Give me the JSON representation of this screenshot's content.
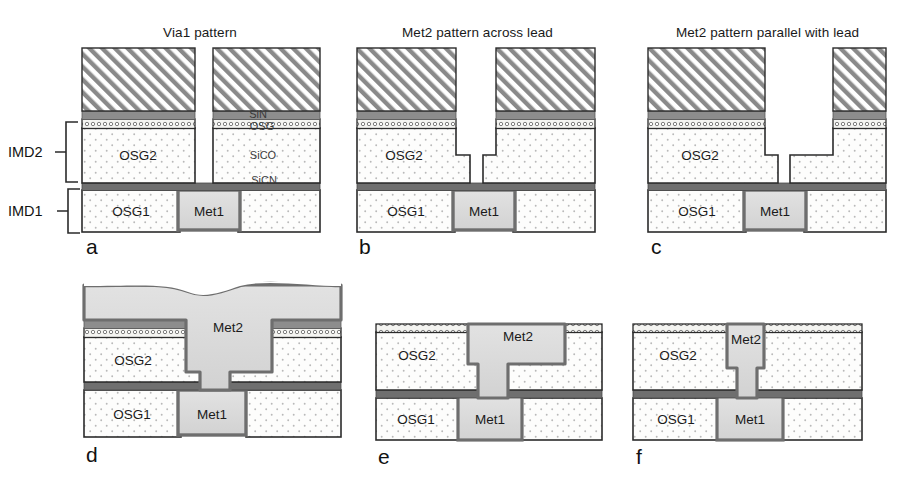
{
  "figure": {
    "caption_letters": [
      "a",
      "b",
      "c",
      "d",
      "e",
      "f"
    ],
    "colors": {
      "osg_fill": "#fdfdfc",
      "osg_dot": "#b9b9b9",
      "cap_osg_fill": "#f2f2ef",
      "sin_gray": "#8d8d8d",
      "sicn_dark": "#6f6f6f",
      "metal_fill": "#d9d9d9",
      "metal_edge": "#6e6e6e",
      "resist_hatch": "#8a8a8a",
      "outline": "#2b2b2b",
      "background": "#ffffff"
    }
  },
  "brackets": [
    {
      "id": "imd2",
      "label": "IMD2"
    },
    {
      "id": "imd1",
      "label": "IMD1"
    }
  ],
  "panels": [
    {
      "id": "a",
      "letter": "a",
      "title": "Via1 pattern",
      "layer_labels": [
        "OSG2",
        "OSG1",
        "Met1"
      ],
      "annotations": [
        "SiN",
        "OSG",
        "SiCO",
        "SiCN"
      ],
      "description": "Via1 photoresist pattern opened through stack down to Met1"
    },
    {
      "id": "b",
      "letter": "b",
      "title": "Met2 pattern across lead",
      "layer_labels": [
        "OSG2",
        "OSG1",
        "Met1"
      ],
      "annotations": [],
      "description": "Dual damascene trench etched across the Met1 lead"
    },
    {
      "id": "c",
      "letter": "c",
      "title": "Met2 pattern parallel with lead",
      "layer_labels": [
        "OSG2",
        "OSG1",
        "Met1"
      ],
      "annotations": [],
      "description": "Dual damascene trench etched parallel with the Met1 lead"
    },
    {
      "id": "d",
      "letter": "d",
      "title": "",
      "layer_labels": [
        "Met2",
        "OSG2",
        "OSG1",
        "Met1"
      ],
      "annotations": [],
      "description": "Copper Met2 fill with overburden before CMP"
    },
    {
      "id": "e",
      "letter": "e",
      "title": "",
      "layer_labels": [
        "Met2",
        "OSG2",
        "OSG1",
        "Met1"
      ],
      "annotations": [],
      "description": "After CMP, wide Met2 lead across via"
    },
    {
      "id": "f",
      "letter": "f",
      "title": "",
      "layer_labels": [
        "Met2",
        "OSG2",
        "OSG1",
        "Met1"
      ],
      "annotations": [],
      "description": "After CMP, narrow Met2 lead parallel with via"
    }
  ]
}
